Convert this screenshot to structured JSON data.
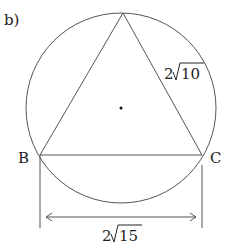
{
  "part_label": "b)",
  "vertices": {
    "B": "B",
    "C": "C"
  },
  "side_label": {
    "coef": "2",
    "radicand": "10"
  },
  "base_label": {
    "coef": "2",
    "radicand": "15"
  },
  "colors": {
    "stroke": "#555555",
    "text": "#222222"
  }
}
